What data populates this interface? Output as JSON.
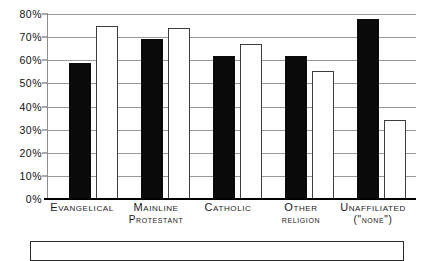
{
  "chart_data": {
    "type": "bar",
    "title": "",
    "subtitle": "",
    "xlabel": "",
    "ylabel": "",
    "ylim": [
      0,
      80
    ],
    "ytick_step": 10,
    "grid": true,
    "legend_position": "none",
    "categories": [
      "Evangelical",
      "Mainline",
      "Catholic",
      "Other",
      "Unaffiliated"
    ],
    "category_sublabels": [
      "",
      "Protestant",
      "",
      "religion",
      "(\"none\")"
    ],
    "ytick_labels": [
      "0%",
      "10%",
      "20%",
      "30%",
      "40%",
      "50%",
      "60%",
      "70%",
      "80%"
    ],
    "ytick_values": [
      0,
      10,
      20,
      30,
      40,
      50,
      60,
      70,
      80
    ],
    "series": [
      {
        "name": "black-series",
        "color": "#0a0a0a",
        "values": [
          59,
          69,
          62,
          62,
          78
        ]
      },
      {
        "name": "white-series",
        "color": "#ffffff",
        "values": [
          75,
          74,
          67,
          55.5,
          34
        ]
      }
    ]
  },
  "colors": {
    "bar_black": "#0a0a0a",
    "bar_white": "#ffffff",
    "bar_white_border": "#3d3d3d",
    "gridline": "#9a9a9a",
    "axis": "#000000",
    "text": "#1a1a1a",
    "background": "#ffffff"
  }
}
